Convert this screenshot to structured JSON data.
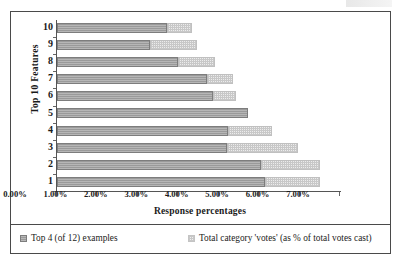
{
  "chart_data": {
    "type": "bar",
    "orientation": "horizontal",
    "stacked": true,
    "title": "",
    "xlabel": "Response percentages",
    "ylabel": "Top 10 Features",
    "categories": [
      "1",
      "2",
      "3",
      "4",
      "5",
      "6",
      "7",
      "8",
      "9",
      "10"
    ],
    "category_order_top_to_bottom": [
      "10",
      "9",
      "8",
      "7",
      "6",
      "5",
      "4",
      "3",
      "2",
      "1"
    ],
    "xlim": [
      0,
      7
    ],
    "xtick_labels": [
      "0.00%",
      "1.00%",
      "2.00%",
      "3.00%",
      "4.00%",
      "5.00%",
      "6.00%",
      "7.00%"
    ],
    "xtick_values": [
      0,
      1,
      2,
      3,
      4,
      5,
      6,
      7
    ],
    "grid": false,
    "legend_position": "bottom",
    "series": [
      {
        "name": "Top 4 (of 12) examples",
        "color": "#9a9a9a",
        "pattern": "solid-gray",
        "values": [
          5.14,
          5.05,
          4.2,
          4.24,
          4.73,
          3.87,
          3.7,
          3.0,
          2.3,
          2.72
        ]
      },
      {
        "name": "Total category 'votes' (as % of total votes cast)",
        "color": "#ececec",
        "pattern": "dotted-light",
        "values": [
          1.36,
          1.45,
          1.77,
          1.07,
          0.0,
          0.57,
          0.66,
          0.9,
          1.16,
          0.61
        ]
      }
    ],
    "totals": [
      6.5,
      6.5,
      5.97,
      5.31,
      4.73,
      4.44,
      4.36,
      3.9,
      3.46,
      3.33
    ]
  },
  "axes": {
    "y_title": "Top 10 Features",
    "x_title": "Response percentages",
    "y_tick_labels": [
      "10",
      "9",
      "8",
      "7",
      "6",
      "5",
      "4",
      "3",
      "2",
      "1"
    ],
    "x_tick_labels": [
      "0.00%",
      "1.00%",
      "2.00%",
      "3.00%",
      "4.00%",
      "5.00%",
      "6.00%",
      "7.00%"
    ]
  },
  "legend": {
    "items": [
      {
        "label": "Top 4 (of 12) examples",
        "swatch": "dark-gray-swatch"
      },
      {
        "label": "Total category 'votes' (as % of total votes cast)",
        "swatch": "light-dotted-swatch"
      }
    ]
  },
  "colors": {
    "series_1": "#9a9a9a",
    "series_2": "#ececec",
    "frame": "#4a4a4a",
    "axis": "#555555",
    "text": "#1a1a1a"
  }
}
